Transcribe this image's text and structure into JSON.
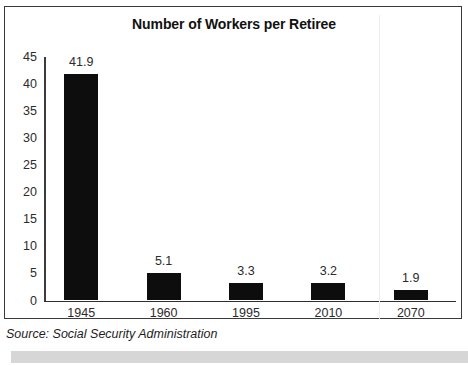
{
  "chart_data": {
    "type": "bar",
    "title": "Number of Workers per Retiree",
    "xlabel": "",
    "ylabel": "",
    "categories": [
      "1945",
      "1960",
      "1995",
      "2010",
      "2070"
    ],
    "values": [
      41.9,
      5.1,
      3.3,
      3.2,
      1.9
    ],
    "value_labels": [
      "41.9",
      "5.1",
      "3.3",
      "3.2",
      "1.9"
    ],
    "ylim": [
      0,
      45
    ],
    "ytick_labels": [
      "0",
      "5",
      "10",
      "15",
      "20",
      "25",
      "30",
      "35",
      "40",
      "45"
    ],
    "yticks": [
      0,
      5,
      10,
      15,
      20,
      25,
      30,
      35,
      40,
      45
    ],
    "grid": false,
    "legend": false,
    "bar_color": "#0d0d0d",
    "axis_color": "#3c3c3c",
    "background": "#ffffff"
  },
  "source": {
    "note": "Source: Social Security Administration"
  },
  "frame": {
    "border_color": "#3a3a3a"
  },
  "bottom_band": {
    "color": "#d6d6d6"
  }
}
